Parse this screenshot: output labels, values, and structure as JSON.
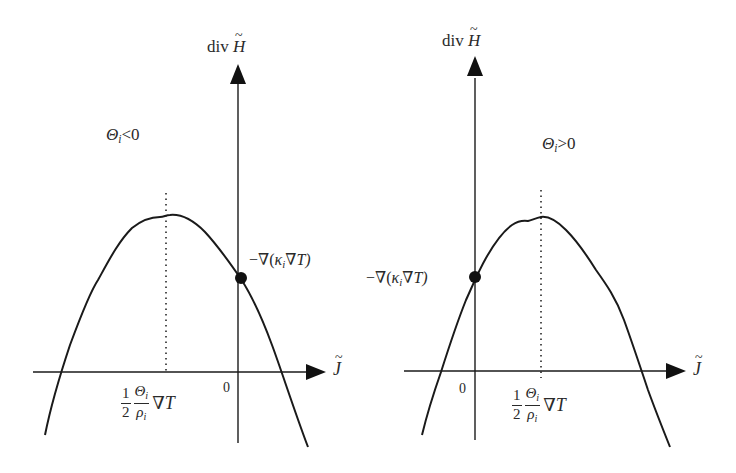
{
  "figure": {
    "panels": [
      {
        "id": "left",
        "condition": "Θᵢ<0",
        "condition_parts": {
          "symbol": "Θ",
          "sub": "i",
          "op": "<",
          "value": "0"
        },
        "y_axis_label": {
          "prefix": "div",
          "var": "H"
        },
        "x_axis_label": "J",
        "origin_label": "0",
        "point_label": "−∇(κᵢ∇T)",
        "point_label_parts": {
          "pre": "−∇(",
          "kappa": "κ",
          "sub": "i",
          "post": "∇T)"
        },
        "vertex_label": {
          "num": "1",
          "den": "2",
          "frac2_num": "Θ",
          "frac2_num_sub": "i",
          "frac2_den": "ρ",
          "frac2_den_sub": "i",
          "tail": "∇T"
        }
      },
      {
        "id": "right",
        "condition": "Θᵢ>0",
        "condition_parts": {
          "symbol": "Θ",
          "sub": "i",
          "op": ">",
          "value": "0"
        },
        "y_axis_label": {
          "prefix": "div",
          "var": "H"
        },
        "x_axis_label": "J",
        "origin_label": "0",
        "point_label": "−∇(κᵢ∇T)",
        "point_label_parts": {
          "pre": "−∇(",
          "kappa": "κ",
          "sub": "i",
          "post": "∇T)"
        },
        "vertex_label": {
          "num": "1",
          "den": "2",
          "frac2_num": "Θ",
          "frac2_num_sub": "i",
          "frac2_den": "ρ",
          "frac2_den_sub": "i",
          "tail": "∇T"
        }
      }
    ],
    "colors": {
      "stroke": "#1a1a1a",
      "background": "#ffffff"
    }
  }
}
